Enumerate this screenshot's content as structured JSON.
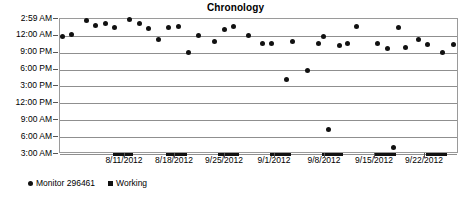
{
  "chart": {
    "title": "Chronology",
    "xlabel": "",
    "ylabel": ""
  },
  "legend": {
    "position": "bottom-left",
    "entries": [
      {
        "label": "Monitor 296461",
        "marker": "circle",
        "color": "#111111"
      },
      {
        "label": "Working",
        "marker": "square",
        "color": "#111111"
      }
    ]
  },
  "chart_data": {
    "type": "scatter",
    "title": "Chronology",
    "xlabel": "",
    "ylabel": "",
    "grid": true,
    "legend_position": "bottom-left",
    "y_tick_labels": [
      "2:59 AM",
      "12:00 AM",
      "9:00 PM",
      "6:00 PM",
      "3:00 PM",
      "12:00 PM",
      "9:00 AM",
      "6:00 AM",
      "3:00 AM"
    ],
    "y_tick_values": [
      26.983,
      24.0,
      21.0,
      18.0,
      15.0,
      12.0,
      9.0,
      6.0,
      3.0
    ],
    "ylim": [
      3.0,
      26.983
    ],
    "x_tick_labels": [
      "8/11/2012",
      "8/18/2012",
      "9/25/2012",
      "9/1/2012",
      "9/8/2012",
      "9/15/2012",
      "9/22/2012"
    ],
    "x_tick_positions": [
      0.1629,
      0.2882,
      0.4135,
      0.5388,
      0.6642,
      0.7895,
      0.9148
    ],
    "xlim_labels": [
      "8/6/2012",
      "9/26/2012"
    ],
    "series": [
      {
        "name": "Monitor 296461",
        "marker": "circle",
        "color": "#111111",
        "points": [
          {
            "x": 0.0075,
            "y": 23.95
          },
          {
            "x": 0.0276,
            "y": 24.2
          },
          {
            "x": 0.0653,
            "y": 26.8
          },
          {
            "x": 0.0878,
            "y": 25.9
          },
          {
            "x": 0.1129,
            "y": 26.1
          },
          {
            "x": 0.1355,
            "y": 25.5
          },
          {
            "x": 0.1731,
            "y": 26.95
          },
          {
            "x": 0.1982,
            "y": 26.2
          },
          {
            "x": 0.2208,
            "y": 25.3
          },
          {
            "x": 0.2459,
            "y": 23.4
          },
          {
            "x": 0.2709,
            "y": 25.5
          },
          {
            "x": 0.296,
            "y": 25.7
          },
          {
            "x": 0.3211,
            "y": 21.0
          },
          {
            "x": 0.3462,
            "y": 24.1
          },
          {
            "x": 0.3863,
            "y": 22.9
          },
          {
            "x": 0.4114,
            "y": 25.1
          },
          {
            "x": 0.434,
            "y": 25.6
          },
          {
            "x": 0.4716,
            "y": 24.1
          },
          {
            "x": 0.5068,
            "y": 22.6
          },
          {
            "x": 0.5294,
            "y": 22.6
          },
          {
            "x": 0.5669,
            "y": 16.3
          },
          {
            "x": 0.582,
            "y": 23.0
          },
          {
            "x": 0.6196,
            "y": 17.8
          },
          {
            "x": 0.6471,
            "y": 22.7
          },
          {
            "x": 0.6597,
            "y": 23.9
          },
          {
            "x": 0.6722,
            "y": 7.3
          },
          {
            "x": 0.6998,
            "y": 22.2
          },
          {
            "x": 0.7198,
            "y": 22.6
          },
          {
            "x": 0.7424,
            "y": 25.7
          },
          {
            "x": 0.7951,
            "y": 22.6
          },
          {
            "x": 0.8201,
            "y": 21.8
          },
          {
            "x": 0.8352,
            "y": 4.2
          },
          {
            "x": 0.8477,
            "y": 25.4
          },
          {
            "x": 0.8653,
            "y": 21.9
          },
          {
            "x": 0.8979,
            "y": 23.3
          },
          {
            "x": 0.9205,
            "y": 22.4
          },
          {
            "x": 0.9581,
            "y": 21.0
          },
          {
            "x": 0.9857,
            "y": 22.4
          }
        ]
      },
      {
        "name": "Working",
        "marker": "square",
        "color": "#111111",
        "y": 3.0,
        "bars": [
          {
            "x_start": 0.1329,
            "x_end": 0.183
          },
          {
            "x_start": 0.2656,
            "x_end": 0.3182
          },
          {
            "x_start": 0.3959,
            "x_end": 0.4485
          },
          {
            "x_start": 0.5262,
            "x_end": 0.5789
          },
          {
            "x_start": 0.6566,
            "x_end": 0.7093
          },
          {
            "x_start": 0.7895,
            "x_end": 0.8421
          },
          {
            "x_start": 0.9173,
            "x_end": 0.9699
          }
        ]
      }
    ]
  },
  "footer": {
    "cropped_text": ""
  }
}
